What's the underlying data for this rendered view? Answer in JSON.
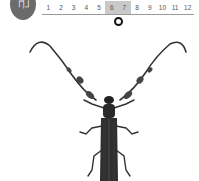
{
  "badge": {
    "label": "근"
  },
  "timeline": {
    "months": [
      "1",
      "2",
      "3",
      "4",
      "5",
      "6",
      "7",
      "8",
      "9",
      "10",
      "11",
      "12"
    ],
    "highlighted": [
      "6",
      "7"
    ],
    "marker_month": "6-7"
  },
  "illustration": {
    "subject": "longhorn-beetle"
  },
  "colors": {
    "badge": "#6b6b6b",
    "highlight": "#c9c9c9",
    "line": "#9a9a9a"
  }
}
